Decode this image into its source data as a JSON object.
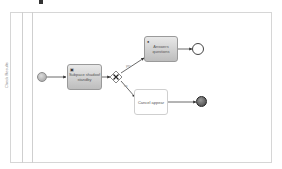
{
  "diagram": {
    "type": "BPMN process",
    "lane": {
      "label": "Check Results"
    },
    "nodes": {
      "start_event": {
        "type": "start-event"
      },
      "task_subprocess": {
        "label": "Subpace shadoof standby",
        "marker": "subprocess",
        "style": "grey"
      },
      "gateway": {
        "type": "exclusive-gateway",
        "symbol": "X"
      },
      "task_answers": {
        "label": "Answers questions",
        "marker": "user",
        "style": "grey"
      },
      "task_cancel": {
        "label": "Cancel appear",
        "style": "white"
      },
      "end_event_plain": {
        "type": "end-event"
      },
      "end_event_filled": {
        "type": "terminate-end-event"
      }
    },
    "flows": [
      {
        "from": "start_event",
        "to": "task_subprocess"
      },
      {
        "from": "task_subprocess",
        "to": "gateway"
      },
      {
        "from": "gateway",
        "to": "task_answers",
        "label": "yes"
      },
      {
        "from": "gateway",
        "to": "task_cancel",
        "label": "no"
      },
      {
        "from": "task_answers",
        "to": "end_event_plain"
      },
      {
        "from": "task_cancel",
        "to": "end_event_filled"
      }
    ],
    "colors": {
      "line": "#444444",
      "task_fill_top": "#e8e8e8",
      "task_fill_bottom": "#bdbdbd",
      "pool_border": "#d6d6d6"
    }
  }
}
